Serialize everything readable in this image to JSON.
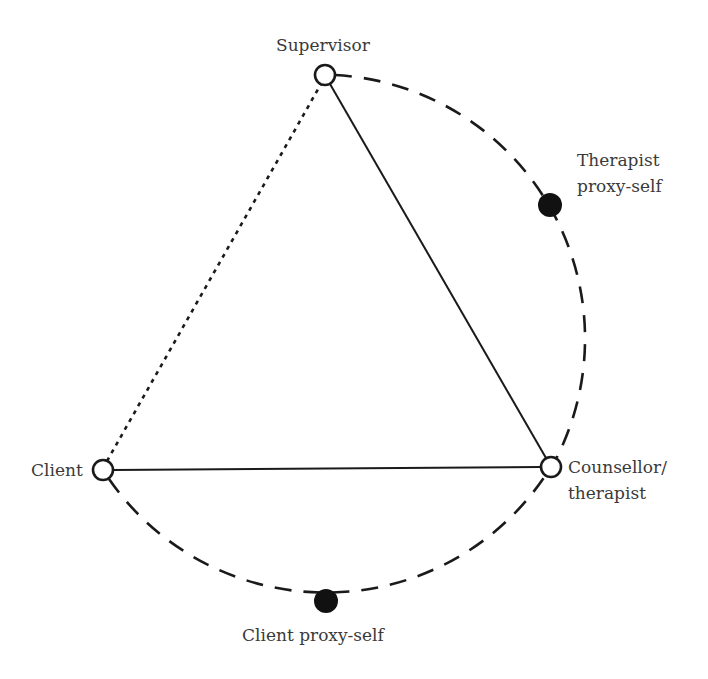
{
  "diagram": {
    "colors": {
      "stroke": "#1a1a1a",
      "text": "#3a3a3a",
      "background": "#ffffff",
      "filled_node": "#111111"
    },
    "nodes": [
      {
        "id": "supervisor",
        "label": "Supervisor",
        "shape": "open-circle"
      },
      {
        "id": "client",
        "label": "Client",
        "shape": "open-circle"
      },
      {
        "id": "counsellor",
        "label_line1": "Counsellor/",
        "label_line2": "therapist",
        "shape": "open-circle"
      },
      {
        "id": "therapist-proxy",
        "label_line1": "Therapist",
        "label_line2": "proxy-self",
        "shape": "filled-circle"
      },
      {
        "id": "client-proxy",
        "label": "Client proxy-self",
        "shape": "filled-circle"
      }
    ],
    "edges": [
      {
        "from": "supervisor",
        "to": "counsellor",
        "style": "solid"
      },
      {
        "from": "client",
        "to": "counsellor",
        "style": "solid"
      },
      {
        "from": "client",
        "to": "supervisor",
        "style": "dotted"
      },
      {
        "from": "supervisor",
        "to": "counsellor",
        "style": "dashed-arc",
        "via": "therapist-proxy"
      },
      {
        "from": "client",
        "to": "counsellor",
        "style": "dashed-arc",
        "via": "client-proxy"
      }
    ]
  }
}
